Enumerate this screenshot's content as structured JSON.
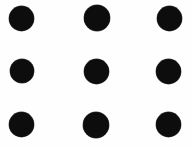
{
  "figure": {
    "title": "Three by three grid of solid black dots",
    "kind": "dot-grid",
    "background_color": "#fefefe",
    "dot_color": "#0d0d0d",
    "canvas": {
      "width": 192,
      "height": 147
    },
    "grid": {
      "rows": 3,
      "columns": 3,
      "dot_count": 9,
      "dot_diameter": 25,
      "column_centers_x": [
        21.5,
        96.5,
        169.5
      ],
      "row_centers_y": [
        18,
        71,
        124.5
      ],
      "column_spacing": 74,
      "row_spacing": 53.25
    },
    "dots": [
      {
        "id": "dot-r1c1",
        "row": 1,
        "column": 1,
        "cx": 21.5,
        "cy": 18,
        "d": 25
      },
      {
        "id": "dot-r1c2",
        "row": 1,
        "column": 2,
        "cx": 96.5,
        "cy": 18,
        "d": 26
      },
      {
        "id": "dot-r1c3",
        "row": 1,
        "column": 3,
        "cx": 169.5,
        "cy": 18,
        "d": 25
      },
      {
        "id": "dot-r2c1",
        "row": 2,
        "column": 1,
        "cx": 21.5,
        "cy": 71,
        "d": 24
      },
      {
        "id": "dot-r2c2",
        "row": 2,
        "column": 2,
        "cx": 96.5,
        "cy": 71,
        "d": 25
      },
      {
        "id": "dot-r2c3",
        "row": 2,
        "column": 3,
        "cx": 168.5,
        "cy": 71,
        "d": 25
      },
      {
        "id": "dot-r3c1",
        "row": 3,
        "column": 1,
        "cx": 21.5,
        "cy": 124.5,
        "d": 25
      },
      {
        "id": "dot-r3c2",
        "row": 3,
        "column": 2,
        "cx": 96.0,
        "cy": 124.5,
        "d": 26
      },
      {
        "id": "dot-r3c3",
        "row": 3,
        "column": 3,
        "cx": 168.5,
        "cy": 124.0,
        "d": 25
      }
    ]
  }
}
